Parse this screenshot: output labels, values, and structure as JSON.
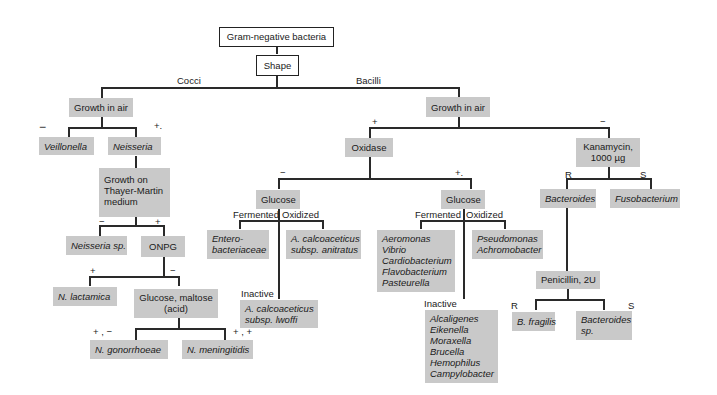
{
  "title": "Gram-negative bacteria",
  "nodes": {
    "root": "Gram-negative bacteria",
    "shape": "Shape",
    "cocci_growth_air": "Growth in air",
    "veillonella": "Veillonella",
    "neisseria": "Neisseria",
    "thayer_martin": [
      "Growth on",
      "Thayer-Martin",
      "medium"
    ],
    "neisseria_sp": "Neisseria sp.",
    "onpg": "ONPG",
    "n_lactamica": "N. lactamica",
    "glucose_maltose": [
      "Glucose, maltose",
      "(acid)"
    ],
    "n_gonorrhoeae": "N. gonorrhoeae",
    "n_meningitidis": "N. meningitidis",
    "bacilli_growth_air": "Growth in air",
    "oxidase": "Oxidase",
    "glucose_neg": "Glucose",
    "enterobacteriaceae": [
      "Entero-",
      "bacteriaceae"
    ],
    "a_calco_anitratus": [
      "A. calcoaceticus",
      "subsp. anitratus"
    ],
    "a_calco_lwoffi": [
      "A. calcoaceticus",
      "subsp. lwoffi"
    ],
    "glucose_pos": "Glucose",
    "fermenters": [
      "Aeromonas",
      "Vibrio",
      "Cardiobacterium",
      "Flavobacterium",
      "Pasteurella"
    ],
    "oxidizers": [
      "Pseudomonas",
      "Achromobacter"
    ],
    "inactive_list": [
      "Alcaligenes",
      "Eikenella",
      "Moraxella",
      "Brucella",
      "Hemophilus",
      "Campylobacter"
    ],
    "kanamycin": [
      "Kanamycin,",
      "1000 µg"
    ],
    "bacteroides": "Bacteroides",
    "fusobacterium": "Fusobacterium",
    "penicillin": "Penicillin, 2U",
    "b_fragilis": "B. fragilis",
    "bacteroides_sp": [
      "Bacteroides",
      "sp."
    ]
  },
  "edge_labels": {
    "cocci": "Cocci",
    "bacilli": "Bacilli",
    "veillonella_minus": "−",
    "neisseria_plus": "+.",
    "tm_minus": "−",
    "tm_plus": "+",
    "onpg_plus": "+",
    "onpg_minus": "−",
    "gon_result": "+ , −",
    "men_result": "+ , +",
    "bac_plus": "+",
    "bac_minus": "−",
    "ox_minus": "−",
    "ox_plus": "+.",
    "fermented_1": "Fermented",
    "oxidized_1": "Oxidized",
    "inactive_1": "Inactive",
    "fermented_2": "Fermented",
    "oxidized_2": "Oxidized",
    "inactive_2": "Inactive",
    "kan_r": "R",
    "kan_s": "S",
    "pen_r": "R",
    "pen_s": "S"
  },
  "colors": {
    "box_fill": "#c9c9c9",
    "line": "#2a2a2a",
    "background": "#ffffff"
  }
}
